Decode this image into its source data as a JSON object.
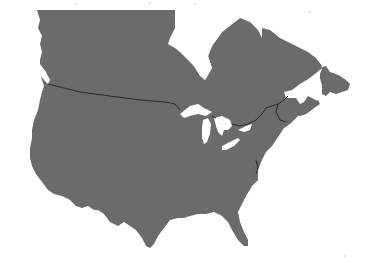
{
  "map": {
    "subject": "North America silhouette (Canada and contiguous United States)",
    "colors": {
      "land": "#6b6b6b",
      "water": "#ffffff",
      "border": "#2a2a2a",
      "background": "#ffffff"
    },
    "regions": [
      {
        "name": "Canada"
      },
      {
        "name": "United States"
      }
    ],
    "features": [
      {
        "name": "Hudson Bay"
      },
      {
        "name": "Great Lakes"
      },
      {
        "name": "Newfoundland"
      },
      {
        "name": "Vancouver Island"
      },
      {
        "name": "Florida"
      },
      {
        "name": "Gulf of St. Lawrence"
      }
    ]
  }
}
